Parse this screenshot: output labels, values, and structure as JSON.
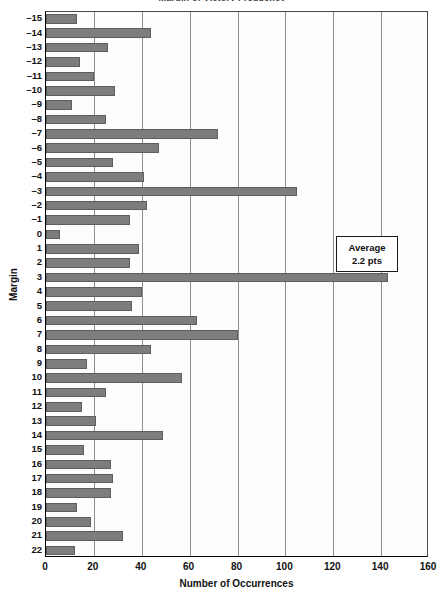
{
  "chart_data": {
    "type": "bar",
    "orientation": "horizontal",
    "title": "Margin of Victory Frequency",
    "xlabel": "Number of Occurrences",
    "ylabel": "Margin",
    "xlim": [
      0,
      160
    ],
    "xticks": [
      0,
      20,
      40,
      60,
      80,
      100,
      120,
      140,
      160
    ],
    "grid": "vertical",
    "legend": "none",
    "bar_color": "#7d7d7d",
    "categories": [
      "-15",
      "-14",
      "-13",
      "-12",
      "-11",
      "-10",
      "-9",
      "-8",
      "-7",
      "-6",
      "-5",
      "-4",
      "-3",
      "-2",
      "-1",
      "0",
      "1",
      "2",
      "3",
      "4",
      "5",
      "6",
      "7",
      "8",
      "9",
      "10",
      "11",
      "12",
      "13",
      "14",
      "15",
      "16",
      "17",
      "18",
      "19",
      "20",
      "21",
      "22"
    ],
    "values": [
      13,
      44,
      26,
      14,
      20,
      29,
      11,
      25,
      72,
      47,
      28,
      41,
      105,
      42,
      35,
      6,
      39,
      35,
      143,
      40,
      36,
      63,
      80,
      44,
      17,
      57,
      25,
      15,
      21,
      49,
      16,
      27,
      28,
      27,
      13,
      19,
      32,
      12
    ],
    "annotations": [
      {
        "name": "average-callout",
        "line1": "Average",
        "line2": "2.2 pts",
        "value": 2.2,
        "unit": "pts"
      }
    ]
  }
}
